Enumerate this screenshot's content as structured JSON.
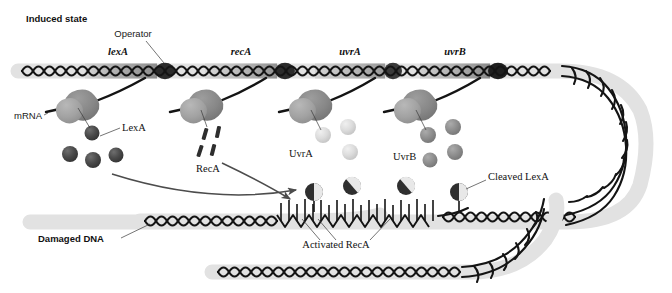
{
  "figure": {
    "title": "Induced state",
    "width": 672,
    "height": 293
  },
  "labels": {
    "induced_state": "Induced state",
    "operator": "Operator",
    "mrna": "mRNA",
    "lexa": "LexA",
    "reca": "RecA",
    "uvra": "UvrA",
    "uvrb": "UvrB",
    "damaged_dna": "Damaged DNA",
    "activated_reca": "Activated RecA",
    "cleaved_lexa": "Cleaved LexA"
  },
  "genes": [
    {
      "name": "lexA",
      "x": 118,
      "label_y": 52
    },
    {
      "name": "recA",
      "x": 241,
      "label_y": 52
    },
    {
      "name": "uvrA",
      "x": 350,
      "label_y": 52
    },
    {
      "name": "uvrB",
      "x": 455,
      "label_y": 52
    }
  ],
  "transcription_units": [
    {
      "gene": "lexA",
      "protein": "LexA",
      "protein_shade": "#4a4a4a"
    },
    {
      "gene": "recA",
      "protein": "RecA",
      "protein_shade": "#2e2e2e"
    },
    {
      "gene": "uvrA",
      "protein": "UvrA",
      "protein_shade": "#dcdcdc"
    },
    {
      "gene": "uvrB",
      "protein": "UvrB",
      "protein_shade": "#8e8e8e"
    }
  ],
  "colors": {
    "dna_strand": "#141414",
    "dna_halo": "#e2e2e2",
    "gene_band_light": "#c9c9c9",
    "gene_band_mid": "#9a9a9a",
    "operator_dark": "#2b2b2b",
    "ribosome_light": "#a8a8a8",
    "ribosome_dark": "#8a8a8a",
    "lexa_sphere": "#4a4a4a",
    "uvra_sphere": "#dcdcdc",
    "uvrb_sphere": "#8e8e8e",
    "arrow": "#4c4c4c",
    "text": "#111111",
    "background": "#ffffff"
  }
}
